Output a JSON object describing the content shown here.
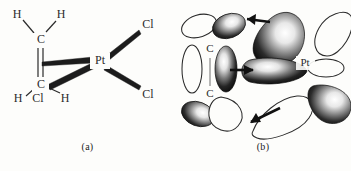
{
  "figure": {
    "background_color": "#fdfdfb",
    "ink_color": "#2b2b2b",
    "lobe_fill_dark": "#1a1a1a",
    "lobe_fill_light": "#ffffff"
  },
  "panels": [
    {
      "id": "a",
      "caption": "(a)",
      "description": "Structural formula of the ethylene-platinum dichloride fragment",
      "atoms": [
        {
          "label": "H",
          "name": "hydrogen-top-left"
        },
        {
          "label": "H",
          "name": "hydrogen-top-right"
        },
        {
          "label": "C",
          "name": "carbon-upper"
        },
        {
          "label": "C",
          "name": "carbon-lower"
        },
        {
          "label": "H",
          "name": "hydrogen-bottom-left"
        },
        {
          "label": "Cl",
          "name": "chlorine-bottom"
        },
        {
          "label": "H",
          "name": "hydrogen-bottom-right"
        },
        {
          "label": "Pt",
          "name": "platinum-center"
        },
        {
          "label": "Cl",
          "name": "chlorine-upper-right"
        },
        {
          "label": "Cl",
          "name": "chlorine-lower-right"
        }
      ],
      "bonds": [
        {
          "name": "bond-c-upper-h-left",
          "type": "single"
        },
        {
          "name": "bond-c-upper-h-right",
          "type": "single"
        },
        {
          "name": "bond-c-c",
          "type": "double"
        },
        {
          "name": "bond-c-lower-h-left",
          "type": "single"
        },
        {
          "name": "bond-c-lower-h-right",
          "type": "single"
        },
        {
          "name": "bond-c-upper-pt",
          "type": "wedge"
        },
        {
          "name": "bond-c-lower-pt",
          "type": "wedge"
        },
        {
          "name": "bond-pt-cl-upper",
          "type": "wedge"
        },
        {
          "name": "bond-pt-cl-lower",
          "type": "wedge"
        }
      ]
    },
    {
      "id": "b",
      "caption": "(b)",
      "description": "Orbital overlap picture: ethylene pi donation to Pt and Pt d back-donation to ethylene pi*",
      "atoms": [
        {
          "label": "C",
          "name": "carbon-upper-orbital"
        },
        {
          "label": "C",
          "name": "carbon-lower-orbital"
        },
        {
          "label": "Pt",
          "name": "platinum-orbital"
        }
      ],
      "arrows": [
        {
          "name": "arrow-backdonation-top",
          "direction": "left",
          "meaning": "Pt to C"
        },
        {
          "name": "arrow-pi-donation-middle",
          "direction": "right",
          "meaning": "C to Pt"
        },
        {
          "name": "arrow-backdonation-bottom",
          "direction": "left",
          "meaning": "Pt to C"
        }
      ],
      "orbital_count": 13
    }
  ]
}
